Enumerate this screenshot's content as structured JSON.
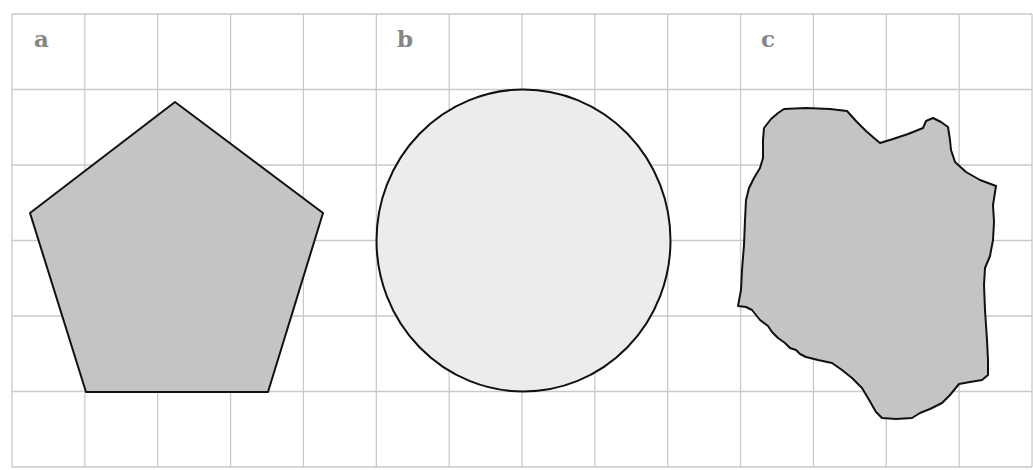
{
  "figure": {
    "grid": {
      "left": 12,
      "top": 14,
      "right": 1032,
      "bottom": 467,
      "columns": 14,
      "rows": 6,
      "line_color": "#c9c9c9"
    },
    "panels": [
      {
        "label": "a",
        "shape": "pentagon",
        "fill": "#c4c4c4",
        "label_pos": [
          34,
          47
        ]
      },
      {
        "label": "b",
        "shape": "circle",
        "fill": "#ececec",
        "label_pos": [
          397,
          47
        ]
      },
      {
        "label": "c",
        "shape": "irregular-blob",
        "fill": "#c4c4c4",
        "label_pos": [
          761,
          47
        ]
      }
    ],
    "outline_color": "#111111"
  }
}
